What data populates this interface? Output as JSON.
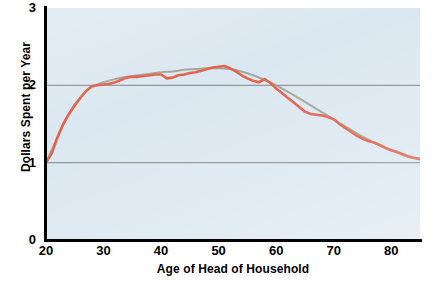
{
  "chart_data": {
    "type": "line",
    "title": "",
    "xlabel": "Age of Head of Household",
    "ylabel": "Dollars Spent per Year",
    "xlim": [
      20,
      85
    ],
    "ylim": [
      0,
      3
    ],
    "xticks": [
      "20",
      "30",
      "40",
      "50",
      "60",
      "70",
      "80"
    ],
    "xtick_values": [
      20,
      30,
      40,
      50,
      60,
      70,
      80
    ],
    "yticks": [
      "0",
      "1",
      "2",
      "3"
    ],
    "ytick_values": [
      0,
      1,
      2,
      3
    ],
    "grid": "horizontal gridlines at y=1 and y=2",
    "gridline_values": [
      1,
      2
    ],
    "legend": "none",
    "plot_background_color": "#dce8f1",
    "series": [
      {
        "name": "observed",
        "color": "#e4614b",
        "style": "jagged line",
        "x": [
          20,
          21,
          22,
          23,
          24,
          25,
          26,
          27,
          28,
          29,
          30,
          31,
          32,
          33,
          34,
          35,
          36,
          37,
          38,
          39,
          40,
          41,
          42,
          43,
          44,
          45,
          46,
          47,
          48,
          49,
          50,
          51,
          52,
          53,
          54,
          55,
          56,
          57,
          58,
          59,
          60,
          61,
          62,
          63,
          64,
          65,
          66,
          67,
          68,
          69,
          70,
          71,
          72,
          73,
          74,
          75,
          76,
          77,
          78,
          79,
          80,
          81,
          82,
          83,
          84,
          85
        ],
        "values": [
          1.0,
          1.12,
          1.33,
          1.5,
          1.63,
          1.74,
          1.84,
          1.93,
          1.99,
          2.0,
          2.01,
          2.02,
          2.04,
          2.07,
          2.1,
          2.11,
          2.11,
          2.12,
          2.13,
          2.14,
          2.14,
          2.09,
          2.1,
          2.13,
          2.14,
          2.16,
          2.17,
          2.19,
          2.21,
          2.23,
          2.24,
          2.25,
          2.22,
          2.18,
          2.13,
          2.09,
          2.06,
          2.04,
          2.08,
          2.03,
          1.96,
          1.9,
          1.84,
          1.78,
          1.72,
          1.66,
          1.63,
          1.62,
          1.61,
          1.59,
          1.56,
          1.5,
          1.45,
          1.4,
          1.35,
          1.31,
          1.28,
          1.26,
          1.23,
          1.19,
          1.16,
          1.14,
          1.11,
          1.08,
          1.06,
          1.05
        ]
      },
      {
        "name": "smooth-trend",
        "color": "#9a9a8c",
        "style": "smooth line",
        "x": [
          20,
          22,
          24,
          26,
          28,
          30,
          32,
          34,
          36,
          38,
          40,
          42,
          44,
          46,
          48,
          50,
          52,
          54,
          56,
          58,
          60,
          62,
          64,
          66,
          68,
          70,
          72,
          74,
          76,
          78,
          80,
          82,
          84,
          85
        ],
        "values": [
          1.0,
          1.33,
          1.64,
          1.85,
          1.98,
          2.04,
          2.08,
          2.11,
          2.13,
          2.15,
          2.17,
          2.18,
          2.2,
          2.21,
          2.22,
          2.22,
          2.21,
          2.18,
          2.13,
          2.07,
          2.0,
          1.92,
          1.83,
          1.74,
          1.65,
          1.56,
          1.47,
          1.38,
          1.3,
          1.22,
          1.16,
          1.1,
          1.06,
          1.04
        ]
      }
    ]
  }
}
